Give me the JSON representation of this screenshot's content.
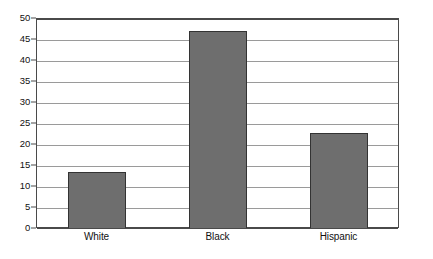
{
  "chart_data": {
    "type": "bar",
    "title": "",
    "subtitle": "",
    "xlabel": "",
    "ylabel": "",
    "categories": [
      "White",
      "Black",
      "Hispanic"
    ],
    "values": [
      13.4,
      47.0,
      22.7
    ],
    "series": [
      {
        "name": "",
        "values": [
          13.4,
          47.0,
          22.7
        ]
      }
    ],
    "ylim": [
      0,
      50
    ],
    "yticks": [
      0,
      5,
      10,
      15,
      20,
      25,
      30,
      35,
      40,
      45,
      50
    ],
    "ytick_labels": [
      "0",
      "5",
      "10",
      "15",
      "20",
      "25",
      "30",
      "35",
      "40",
      "45",
      "50"
    ],
    "grid": true,
    "legend": false,
    "legend_position": "none",
    "annotations": [],
    "colors": {
      "bar_fill": "#6e6e6e",
      "bar_stroke": "#333333",
      "gridline": "#9a9a9a",
      "axis": "#4a4a4a",
      "plot_background": "#ffffff",
      "page_background": "#ffffff",
      "text": "#111111"
    }
  }
}
